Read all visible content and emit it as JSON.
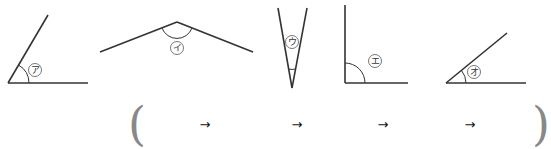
{
  "angles": [
    {
      "id": "a",
      "label": "ア",
      "description": "acute angle ~60°"
    },
    {
      "id": "i",
      "label": "イ",
      "description": "obtuse angle ~150°"
    },
    {
      "id": "u",
      "label": "ウ",
      "description": "very acute angle ~25°"
    },
    {
      "id": "e",
      "label": "エ",
      "description": "right angle 90°"
    },
    {
      "id": "o",
      "label": "オ",
      "description": "acute angle ~40°"
    }
  ],
  "answer": {
    "open_paren": "(",
    "close_paren": ")",
    "arrows": [
      "→",
      "→",
      "→",
      "→"
    ]
  }
}
